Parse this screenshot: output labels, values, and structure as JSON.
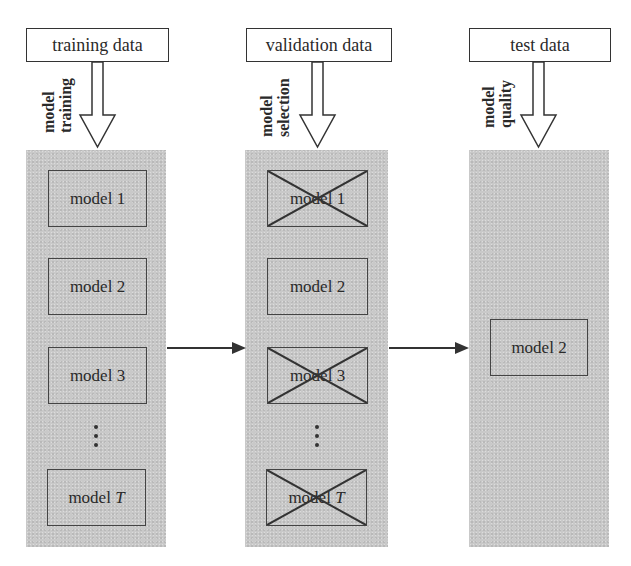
{
  "columns": [
    {
      "header": "training data",
      "arrow_label_line1": "model",
      "arrow_label_line2": "training",
      "models": [
        {
          "prefix": "model",
          "index": "1",
          "crossed": false
        },
        {
          "prefix": "model",
          "index": "2",
          "crossed": false
        },
        {
          "prefix": "model",
          "index": "3",
          "crossed": false
        },
        {
          "prefix": "model",
          "index": "T",
          "crossed": false,
          "italic_index": true
        }
      ],
      "ellipsis": "⋮"
    },
    {
      "header": "validation data",
      "arrow_label_line1": "model",
      "arrow_label_line2": "selection",
      "models": [
        {
          "prefix": "model",
          "index": "1",
          "crossed": true
        },
        {
          "prefix": "model",
          "index": "2",
          "crossed": false
        },
        {
          "prefix": "model",
          "index": "3",
          "crossed": true
        },
        {
          "prefix": "model",
          "index": "T",
          "crossed": true,
          "italic_index": true
        }
      ],
      "ellipsis": "⋮"
    },
    {
      "header": "test data",
      "arrow_label_line1": "model",
      "arrow_label_line2": "quality",
      "models": [
        {
          "prefix": "model",
          "index": "2",
          "crossed": false
        }
      ]
    }
  ],
  "flow_arrows": [
    {
      "from": "training",
      "to": "validation"
    },
    {
      "from": "validation",
      "to": "test"
    }
  ],
  "colors": {
    "panel": "#c9c9c9",
    "stroke": "#333333",
    "background": "#ffffff"
  }
}
